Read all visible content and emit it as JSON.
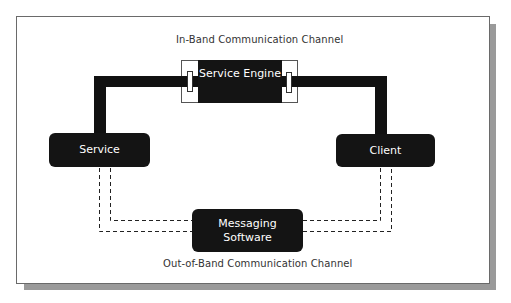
{
  "diagram": {
    "title_top": "In-Band Communication Channel",
    "title_bottom": "Out-of-Band Communication Channel",
    "nodes": {
      "service_engine": "Service Engine",
      "service": "Service",
      "client": "Client",
      "messaging_line1": "Messaging",
      "messaging_line2": "Software"
    },
    "edges": [
      {
        "from": "Service",
        "to": "Service Engine",
        "style": "solid-thick",
        "channel": "in-band"
      },
      {
        "from": "Service Engine",
        "to": "Client",
        "style": "solid-thick",
        "channel": "in-band"
      },
      {
        "from": "Service",
        "to": "Messaging Software",
        "style": "dashed-double",
        "channel": "out-of-band"
      },
      {
        "from": "Messaging Software",
        "to": "Client",
        "style": "dashed-double",
        "channel": "out-of-band"
      }
    ],
    "colors": {
      "node_fill": "#141414",
      "node_text": "#ffffff",
      "line": "#111111",
      "frame_shadow": "#9a9a9a"
    }
  }
}
